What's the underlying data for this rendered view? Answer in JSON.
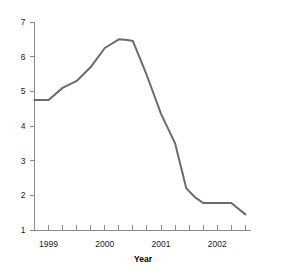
{
  "chart_data": {
    "type": "line",
    "title": "",
    "xlabel": "Year",
    "ylabel": "",
    "xlim": [
      1998.75,
      2002.6
    ],
    "ylim": [
      1,
      7
    ],
    "grid": false,
    "legend": null,
    "line_color": "#6b6b6b",
    "axis_color": "#8a8a8a",
    "background_color": "#ffffff",
    "y_ticks": [
      1,
      2,
      3,
      4,
      5,
      6,
      7
    ],
    "y_tick_labels": [
      "1",
      "2",
      "3",
      "4",
      "5",
      "6",
      "7"
    ],
    "x_ticks": [
      1998.75,
      1999.0,
      1999.25,
      1999.5,
      1999.75,
      2000.0,
      2000.25,
      2000.5,
      2000.75,
      2001.0,
      2001.25,
      2001.5,
      2001.75,
      2002.0,
      2002.25,
      2002.5
    ],
    "x_tick_labels": [
      "1999",
      "2000",
      "2001",
      "2002"
    ],
    "x_label_values": [
      1999.0,
      2000.0,
      2001.0,
      2002.0
    ],
    "series": [
      {
        "name": "value",
        "x": [
          1998.75,
          1999.0,
          1999.25,
          1999.5,
          1999.75,
          2000.0,
          2000.25,
          2000.4,
          2000.5,
          2000.75,
          2001.0,
          2001.25,
          2001.45,
          2001.6,
          2001.75,
          2002.0,
          2002.25,
          2002.5
        ],
        "y": [
          4.75,
          4.75,
          5.1,
          5.3,
          5.7,
          6.25,
          6.5,
          6.48,
          6.45,
          5.45,
          4.35,
          3.5,
          2.2,
          1.95,
          1.78,
          1.78,
          1.78,
          1.45
        ]
      }
    ]
  }
}
